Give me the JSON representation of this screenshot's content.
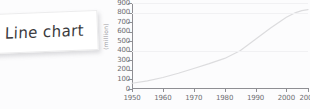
{
  "note": {
    "label": "Line chart"
  },
  "chart_data": {
    "type": "line",
    "title": "",
    "subtitle": "",
    "xlabel": "",
    "ylabel": "(million)",
    "xlim": [
      1950,
      2007
    ],
    "ylim": [
      0,
      900
    ],
    "grid": true,
    "legend": "none",
    "line_color": "#dcdcde",
    "axis_color": "#8e8e93",
    "tick_label_color": "#6e6e72",
    "x_tick_labels": [
      "1950",
      "1960",
      "1970",
      "1980",
      "1990",
      "2000",
      "2007"
    ],
    "x_ticks": [
      1950,
      1960,
      1970,
      1980,
      1990,
      2000,
      2007
    ],
    "y_tick_labels": [
      "900",
      "800",
      "700",
      "600",
      "500",
      "400",
      "300",
      "200",
      "100",
      "0"
    ],
    "y_ticks": [
      900,
      800,
      700,
      600,
      500,
      400,
      300,
      200,
      100,
      0
    ],
    "series": [
      {
        "name": "value",
        "x": [
          1950,
          1955,
          1960,
          1965,
          1970,
          1975,
          1980,
          1985,
          1990,
          1995,
          2000,
          2003,
          2005,
          2007
        ],
        "values": [
          60,
          85,
          120,
          165,
          215,
          265,
          320,
          400,
          520,
          640,
          750,
          800,
          820,
          830
        ]
      }
    ]
  }
}
